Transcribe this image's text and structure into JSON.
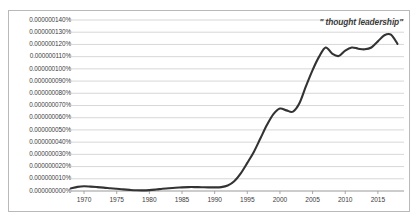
{
  "annotation": {
    "text": "\" thought leadership\""
  },
  "chart_data": {
    "type": "line",
    "title": "",
    "xlabel": "",
    "ylabel": "",
    "annotations": [
      "\" thought leadership\""
    ],
    "grid": true,
    "legend_position": "none",
    "xlim": [
      1968,
      2019
    ],
    "ylim": [
      0.0,
      1.4e-07
    ],
    "ytick_labels": [
      "0.000000140%",
      "0.000000130%",
      "0.000000120%",
      "0.000000110%",
      "0.000000100%",
      "0.000000090%",
      "0.000000080%",
      "0.000000070%",
      "0.000000060%",
      "0.000000050%",
      "0.000000040%",
      "0.000000030%",
      "0.000000020%",
      "0.000000010%",
      "0.000000000%"
    ],
    "ytick_values": [
      1.4e-07,
      1.3e-07,
      1.2e-07,
      1.1e-07,
      1e-07,
      9e-08,
      8e-08,
      7e-08,
      6e-08,
      5e-08,
      4e-08,
      3e-08,
      2e-08,
      1e-08,
      0.0
    ],
    "xtick_labels": [
      "1970",
      "1975",
      "1980",
      "1985",
      "1990",
      "1995",
      "2000",
      "2005",
      "2010",
      "2015"
    ],
    "xtick_values": [
      1970,
      1975,
      1980,
      1985,
      1990,
      1995,
      2000,
      2005,
      2010,
      2015
    ],
    "series": [
      {
        "name": "\" thought leadership\"",
        "color": "#333333",
        "x": [
          1968,
          1969,
          1970,
          1971,
          1972,
          1973,
          1974,
          1975,
          1976,
          1977,
          1978,
          1979,
          1980,
          1981,
          1982,
          1983,
          1984,
          1985,
          1986,
          1987,
          1988,
          1989,
          1990,
          1991,
          1992,
          1993,
          1994,
          1995,
          1996,
          1997,
          1998,
          1999,
          2000,
          2001,
          2002,
          2003,
          2004,
          2005,
          2006,
          2007,
          2008,
          2009,
          2010,
          2011,
          2012,
          2013,
          2014,
          2015,
          2016,
          2017,
          2018
        ],
        "values": [
          2.2e-09,
          3.4e-09,
          3.9e-09,
          3.6e-09,
          3.2e-09,
          2.8e-09,
          2.3e-09,
          1.8e-09,
          1.3e-09,
          9e-10,
          6e-10,
          5e-10,
          7e-10,
          1.2e-09,
          1.8e-09,
          2.3e-09,
          2.7e-09,
          3e-09,
          3.2e-09,
          3.2e-09,
          3.1e-09,
          3e-09,
          3e-09,
          3.2e-09,
          4.5e-09,
          8e-09,
          1.45e-08,
          2.3e-08,
          3.2e-08,
          4.3e-08,
          5.4e-08,
          6.3e-08,
          6.75e-08,
          6.6e-08,
          6.5e-08,
          7.2e-08,
          8.6e-08,
          9.9e-08,
          1.1e-07,
          1.175e-07,
          1.125e-07,
          1.105e-07,
          1.15e-07,
          1.175e-07,
          1.165e-07,
          1.16e-07,
          1.175e-07,
          1.225e-07,
          1.275e-07,
          1.28e-07,
          1.205e-07
        ]
      }
    ]
  }
}
